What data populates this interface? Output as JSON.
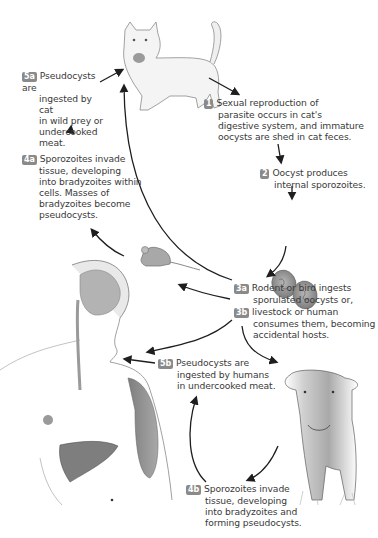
{
  "diagram": {
    "badge_color": "#8a8a8a",
    "arrow_color": "#1e1e1e",
    "steps": {
      "s1": {
        "badge": "1",
        "lines": [
          "Sexual reproduction of",
          "parasite occurs in cat's",
          "digestive system, and immature",
          "oocysts are shed in cat feces."
        ]
      },
      "s2": {
        "badge": "2",
        "lines": [
          "Oocyst produces",
          "internal sporozoites."
        ]
      },
      "s3a": {
        "badge": "3a",
        "lines": [
          "Rodent or bird ingests",
          "sporulated oocysts or,"
        ]
      },
      "s3b": {
        "badge": "3b",
        "lines": [
          "livestock or human",
          "consumes them, becoming",
          "accidental hosts."
        ]
      },
      "s4a": {
        "badge": "4a",
        "lines": [
          "Sporozoites invade",
          "tissue, developing",
          "into bradyzoites within",
          "cells. Masses of",
          "bradyzoites become",
          "pseudocysts."
        ]
      },
      "s4b": {
        "badge": "4b",
        "lines": [
          "Sporozoites invade",
          "tissue, developing",
          "into bradyzoites and",
          "forming pseudocysts."
        ]
      },
      "s5a": {
        "badge": "5a",
        "lines": [
          "Pseudocysts are",
          "ingested by cat",
          "in wild prey or",
          "undercooked",
          "meat."
        ]
      },
      "s5b": {
        "badge": "5b",
        "lines": [
          "Pseudocysts are",
          "ingested by humans",
          "in undercooked meat."
        ]
      }
    },
    "illustrations": [
      "cat-illustration",
      "oocysts-illustration",
      "mouse-illustration",
      "human-illustration",
      "cow-illustration"
    ]
  }
}
